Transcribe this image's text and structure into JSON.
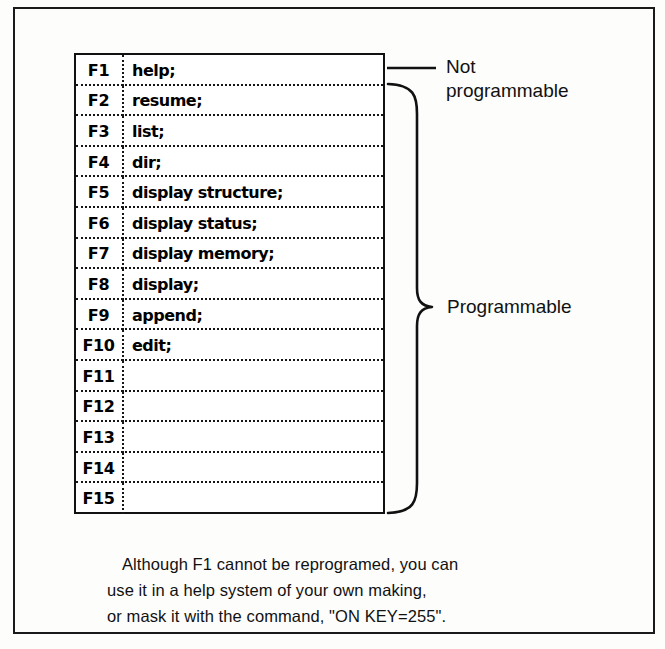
{
  "figure": {
    "ink_color": "#111111",
    "background_color": "#fdfdfc"
  },
  "key_table": {
    "columns": [
      "key",
      "command"
    ],
    "rows": [
      {
        "key": "F1",
        "command": "help;"
      },
      {
        "key": "F2",
        "command": "resume;"
      },
      {
        "key": "F3",
        "command": "list;"
      },
      {
        "key": "F4",
        "command": "dir;"
      },
      {
        "key": "F5",
        "command": "display structure;"
      },
      {
        "key": "F6",
        "command": "display status;"
      },
      {
        "key": "F7",
        "command": "display memory;"
      },
      {
        "key": "F8",
        "command": "display;"
      },
      {
        "key": "F9",
        "command": "append;"
      },
      {
        "key": "F10",
        "command": "edit;"
      },
      {
        "key": "F11",
        "command": ""
      },
      {
        "key": "F12",
        "command": ""
      },
      {
        "key": "F13",
        "command": ""
      },
      {
        "key": "F14",
        "command": ""
      },
      {
        "key": "F15",
        "command": ""
      }
    ]
  },
  "annotations": {
    "not_programmable": "Not\nprogrammable",
    "programmable": "Programmable"
  },
  "caption": {
    "line1": "Although F1 cannot be reprogramed, you can",
    "line2": "use it in a help system of your own making,",
    "line3": "or mask it with the command, \"ON KEY=255\"."
  }
}
